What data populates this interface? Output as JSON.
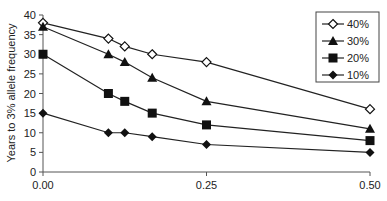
{
  "chart_data": {
    "type": "line",
    "title": "",
    "xlabel": "",
    "ylabel": "Years to 3% allele frequency",
    "xlim": [
      0,
      0.5
    ],
    "ylim": [
      0,
      40
    ],
    "x_ticks": [
      "0.00",
      "0.25",
      "0.50"
    ],
    "y_ticks": [
      "0",
      "5",
      "10",
      "15",
      "20",
      "25",
      "30",
      "35",
      "40"
    ],
    "grid": false,
    "legend_position": "top-right",
    "x": [
      0.0,
      0.1,
      0.125,
      0.167,
      0.25,
      0.5
    ],
    "series": [
      {
        "name": "40%",
        "marker": "diamond-open",
        "values": [
          38,
          34,
          32,
          30,
          28,
          16
        ]
      },
      {
        "name": "30%",
        "marker": "triangle",
        "values": [
          37,
          30,
          28,
          24,
          18,
          11
        ]
      },
      {
        "name": "20%",
        "marker": "square",
        "values": [
          30,
          20,
          18,
          15,
          12,
          8
        ]
      },
      {
        "name": "10%",
        "marker": "diamond",
        "values": [
          15,
          10,
          10,
          9,
          7,
          5
        ]
      }
    ]
  },
  "labels": {
    "ylabel": "Years to 3% allele frequency",
    "x0": "0.00",
    "x1": "0.25",
    "x2": "0.50",
    "y": [
      "0",
      "5",
      "10",
      "15",
      "20",
      "25",
      "30",
      "35",
      "40"
    ],
    "legend": [
      "40%",
      "30%",
      "20%",
      "10%"
    ]
  },
  "colors": {
    "line": "#222222",
    "marker": "#111111",
    "axis": "#555555"
  }
}
